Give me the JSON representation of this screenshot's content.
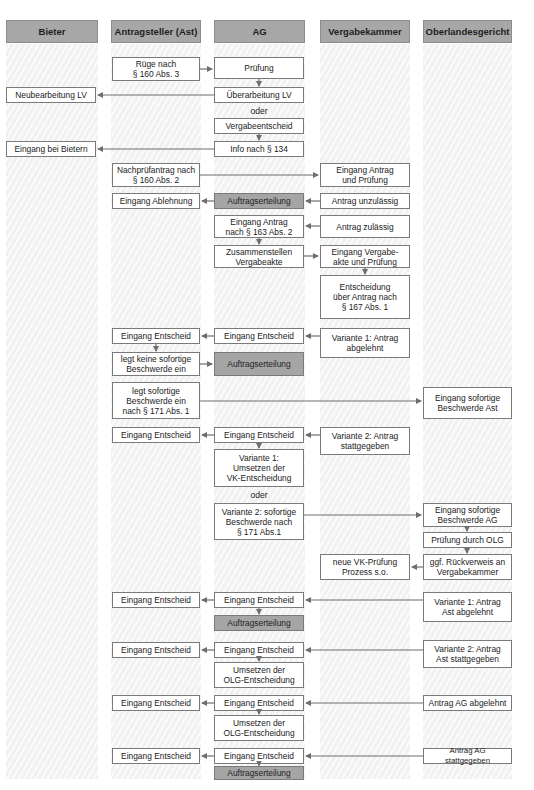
{
  "columns": [
    {
      "id": "bieter",
      "label": "Bieter"
    },
    {
      "id": "ast",
      "label": "Antragsteller (Ast)"
    },
    {
      "id": "ag",
      "label": "AG"
    },
    {
      "id": "vk",
      "label": "Vergabekammer"
    },
    {
      "id": "olg",
      "label": "Oberlandesgericht"
    }
  ],
  "colors": {
    "header_fill": "#a7a7a7",
    "highlight_fill": "#a5a5a5",
    "box_border": "#7a7a7a",
    "arrow": "#6e6e6e",
    "lane_stripe": "#f1f1f1"
  },
  "nodes": {
    "ruege": "Rüge nach\n§ 160 Abs. 3",
    "pruefung": "Prüfung",
    "neubearbeitung_lv": "Neubearbeitung LV",
    "ueberarbeitung_lv": "Überarbeitung LV",
    "oder_1": "oder",
    "vergabeentscheid": "Vergabeentscheid",
    "eingang_bei_bietern": "Eingang bei Bietern",
    "info_134": "Info nach § 134",
    "nachpruefantrag": "Nachprüfantrag nach\n§ 160 Abs. 2",
    "eingang_antrag_pruefung": "Eingang Antrag\nund Prüfung",
    "eingang_ablehnung": "Eingang Ablehnung",
    "auftragserteilung_1": "Auftragserteilung",
    "antrag_unzulaessig": "Antrag unzulässig",
    "eingang_antrag_163": "Eingang Antrag\nnach § 163 Abs. 2",
    "antrag_zulaessig": "Antrag zulässig",
    "zusammenstellen": "Zusammenstellen\nVergabeakte",
    "eingang_vergabeakte": "Eingang Vergabe-\nakte und Prüfung",
    "entscheidung_167": "Entscheidung\nüber Antrag nach\n§ 167 Abs. 1",
    "ast_eingang_entscheid_1": "Eingang Entscheid",
    "ag_eingang_entscheid_1": "Eingang Entscheid",
    "vk_variante1": "Variante 1: Antrag\nabgelehnt",
    "legt_keine": "legt keine sofortige\nBeschwerde ein",
    "auftragserteilung_2": "Auftragserteilung",
    "legt_sofortige": "legt sofortige\nBeschwerde ein\nnach § 171 Abs. 1",
    "olg_eingang_ast": "Eingang sofortige\nBeschwerde Ast",
    "ast_eingang_entscheid_2": "Eingang Entscheid",
    "ag_eingang_entscheid_2": "Eingang Entscheid",
    "vk_variante2": "Variante 2: Antrag\nstattgegeben",
    "ag_variante1_umsetzen": "Variante 1:\nUmsetzen der\nVK-Entscheidung",
    "oder_2": "oder",
    "ag_variante2_beschwerde": "Variante 2: sofortige\nBeschwerde nach\n§ 171 Abs.1",
    "olg_eingang_ag": "Eingang sofortige\nBeschwerde AG",
    "olg_pruefung": "Prüfung durch OLG",
    "vk_neue_pruefung": "neue VK-Prüfung\nProzess s.o.",
    "olg_rueckverweis": "ggf. Rückverweis an\nVergabekammer",
    "ast_eingang_entscheid_3": "Eingang Entscheid",
    "ag_eingang_entscheid_3": "Eingang Entscheid",
    "olg_variante1": "Variante 1: Antrag\nAst abgelehnt",
    "auftragserteilung_3": "Auftragserteilung",
    "ast_eingang_entscheid_4": "Eingang Entscheid",
    "ag_eingang_entscheid_4": "Eingang Entscheid",
    "olg_variante2": "Variante 2: Antrag\nAst stattgegeben",
    "umsetzen_olg_1": "Umsetzen der\nOLG-Entscheidung",
    "ast_eingang_entscheid_5": "Eingang Entscheid",
    "ag_eingang_entscheid_5": "Eingang Entscheid",
    "olg_antrag_ag_abgelehnt": "Antrag AG abgelehnt",
    "umsetzen_olg_2": "Umsetzen der\nOLG-Entscheidung",
    "ast_eingang_entscheid_6": "Eingang Entscheid",
    "ag_eingang_entscheid_6": "Eingang Entscheid",
    "olg_antrag_ag_stattgegeben": "Antrag AG stattgegeben",
    "auftragserteilung_4": "Auftragserteilung"
  }
}
